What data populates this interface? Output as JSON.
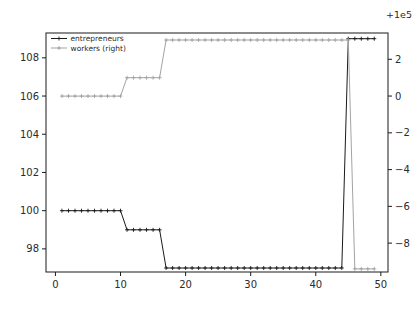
{
  "figure": {
    "background": "#ffffff",
    "text_color": "#2b2b2b",
    "axis_color": "#1a1a1a"
  },
  "chart_data": {
    "type": "line",
    "title": "",
    "xlabel": "",
    "ylabel": "",
    "grid": false,
    "legend_position": "upper-left",
    "x_ticks": [
      0,
      10,
      20,
      30,
      40,
      50
    ],
    "xlim": [
      -1.45,
      51.1
    ],
    "left_axis": {
      "ticks": [
        98,
        100,
        102,
        104,
        106,
        108
      ],
      "lim": [
        96.79,
        109.3
      ]
    },
    "right_axis": {
      "ticks": [
        2,
        0,
        -2,
        -4,
        -6,
        -8
      ],
      "lim": [
        -9.57,
        3.43
      ],
      "offset": "+1e5"
    },
    "x": [
      1,
      2,
      3,
      4,
      5,
      6,
      7,
      8,
      9,
      10,
      11,
      12,
      13,
      14,
      15,
      16,
      17,
      18,
      19,
      20,
      21,
      22,
      23,
      24,
      25,
      26,
      27,
      28,
      29,
      30,
      31,
      32,
      33,
      34,
      35,
      36,
      37,
      38,
      39,
      40,
      41,
      42,
      43,
      44,
      45,
      46,
      47,
      48,
      49
    ],
    "series": [
      {
        "name": "entrepreneurs",
        "axis": "left",
        "color": "#1a1a1a",
        "marker": "plus",
        "values": [
          100,
          100,
          100,
          100,
          100,
          100,
          100,
          100,
          100,
          100,
          99,
          99,
          99,
          99,
          99,
          99,
          97,
          97,
          97,
          97,
          97,
          97,
          97,
          97,
          97,
          97,
          97,
          97,
          97,
          97,
          97,
          97,
          97,
          97,
          97,
          97,
          97,
          97,
          97,
          97,
          97,
          97,
          97,
          97,
          109,
          109,
          109,
          109,
          109
        ]
      },
      {
        "name": "workers (right)",
        "axis": "right",
        "color": "#a3a3a3",
        "marker": "plus",
        "values": [
          0,
          0,
          0,
          0,
          0,
          0,
          0,
          0,
          0,
          0,
          1,
          1,
          1,
          1,
          1,
          1,
          3.05,
          3.05,
          3.05,
          3.05,
          3.05,
          3.05,
          3.05,
          3.05,
          3.05,
          3.05,
          3.05,
          3.05,
          3.05,
          3.05,
          3.05,
          3.05,
          3.05,
          3.05,
          3.05,
          3.05,
          3.05,
          3.05,
          3.05,
          3.05,
          3.05,
          3.05,
          3.05,
          3.05,
          3.05,
          -9.4,
          -9.4,
          -9.4,
          -9.4
        ]
      }
    ]
  }
}
